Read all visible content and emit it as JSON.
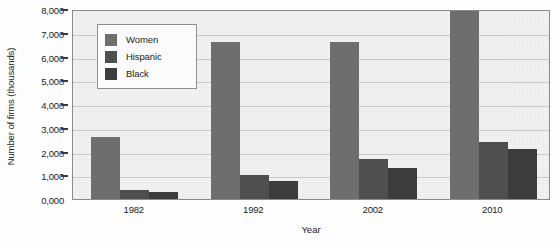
{
  "chart_data": {
    "type": "bar",
    "title": "",
    "subtitle": "",
    "xlabel": "Year",
    "ylabel": "Number of firms (thousands)",
    "categories": [
      "1982",
      "1992",
      "2002",
      "2010"
    ],
    "series": [
      {
        "name": "Women",
        "color": "#6e6e6e",
        "values": [
          2600,
          6600,
          6600,
          8000
        ]
      },
      {
        "name": "Hispanic",
        "color": "#4f4f4f",
        "values": [
          400,
          1000,
          1700,
          2400
        ]
      },
      {
        "name": "Black",
        "color": "#3c3c3c",
        "values": [
          300,
          750,
          1300,
          2100
        ]
      }
    ],
    "ylim": [
      0,
      8000
    ],
    "ytick_labels": [
      "0,000",
      "1,000",
      "2,000",
      "3,000",
      "4,000",
      "5,000",
      "6,000",
      "7,000",
      "8,000"
    ],
    "ytick_values": [
      0,
      1000,
      2000,
      3000,
      4000,
      5000,
      6000,
      7000,
      8000
    ],
    "xtick_labels": [
      "1982",
      "1992",
      "2002",
      "2010"
    ],
    "grid": true,
    "grid_axis": "y",
    "legend_position": "top-left-inside",
    "legend_entries": [
      "Women",
      "Hispanic",
      "Black"
    ],
    "plot_background": "#ececed",
    "figure_background": "#fdfdfd"
  }
}
